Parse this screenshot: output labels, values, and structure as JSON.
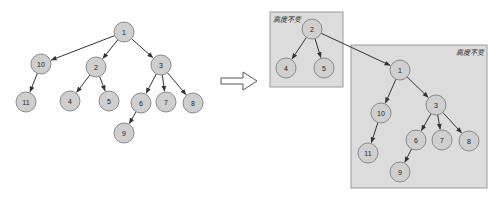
{
  "diagram": {
    "title": "",
    "transform_arrow": "right-arrow-icon",
    "left_tree": {
      "nodes": [
        {
          "id": "1",
          "label": "1",
          "x": 124,
          "y": 32
        },
        {
          "id": "10",
          "label": "10",
          "x": 41,
          "y": 64
        },
        {
          "id": "2",
          "label": "2",
          "x": 96,
          "y": 67
        },
        {
          "id": "3",
          "label": "3",
          "x": 161,
          "y": 65
        },
        {
          "id": "11",
          "label": "11",
          "x": 26,
          "y": 102
        },
        {
          "id": "4",
          "label": "4",
          "x": 70,
          "y": 101
        },
        {
          "id": "5",
          "label": "5",
          "x": 109,
          "y": 101
        },
        {
          "id": "6",
          "label": "6",
          "x": 141,
          "y": 103
        },
        {
          "id": "7",
          "label": "7",
          "x": 166,
          "y": 102
        },
        {
          "id": "8",
          "label": "8",
          "x": 193,
          "y": 103
        },
        {
          "id": "9",
          "label": "9",
          "x": 124,
          "y": 133
        }
      ],
      "edges": [
        [
          "1",
          "10"
        ],
        [
          "1",
          "2"
        ],
        [
          "1",
          "3"
        ],
        [
          "10",
          "11"
        ],
        [
          "2",
          "4"
        ],
        [
          "2",
          "5"
        ],
        [
          "3",
          "6"
        ],
        [
          "3",
          "7"
        ],
        [
          "3",
          "8"
        ],
        [
          "6",
          "9"
        ]
      ]
    },
    "right_tree": {
      "boxes": [
        {
          "id": "box-a",
          "label": "高度不变",
          "x": 270,
          "y": 12,
          "w": 73,
          "h": 75,
          "label_pos": "top-left"
        },
        {
          "id": "box-b",
          "label": "高度不变",
          "x": 351,
          "y": 45,
          "w": 136,
          "h": 143,
          "label_pos": "top-right"
        }
      ],
      "nodes": [
        {
          "id": "2",
          "label": "2",
          "x": 312,
          "y": 29
        },
        {
          "id": "4",
          "label": "4",
          "x": 286,
          "y": 68
        },
        {
          "id": "5",
          "label": "5",
          "x": 324,
          "y": 68
        },
        {
          "id": "1",
          "label": "1",
          "x": 400,
          "y": 70
        },
        {
          "id": "10",
          "label": "10",
          "x": 381,
          "y": 113
        },
        {
          "id": "3",
          "label": "3",
          "x": 436,
          "y": 105
        },
        {
          "id": "11",
          "label": "11",
          "x": 368,
          "y": 153
        },
        {
          "id": "6",
          "label": "6",
          "x": 416,
          "y": 140
        },
        {
          "id": "7",
          "label": "7",
          "x": 442,
          "y": 140
        },
        {
          "id": "8",
          "label": "8",
          "x": 469,
          "y": 141
        },
        {
          "id": "9",
          "label": "9",
          "x": 400,
          "y": 172
        }
      ],
      "edges": [
        [
          "2",
          "4"
        ],
        [
          "2",
          "5"
        ],
        [
          "2",
          "1"
        ],
        [
          "1",
          "10"
        ],
        [
          "1",
          "3"
        ],
        [
          "10",
          "11"
        ],
        [
          "3",
          "6"
        ],
        [
          "3",
          "7"
        ],
        [
          "3",
          "8"
        ],
        [
          "6",
          "9"
        ]
      ]
    },
    "colors": {
      "node_fill": "#cfcfcf",
      "node_stroke": "#8a8a8a",
      "box_fill": "#dcdcdc",
      "box_stroke": "#9a9a9a",
      "edge": "#333333"
    }
  }
}
